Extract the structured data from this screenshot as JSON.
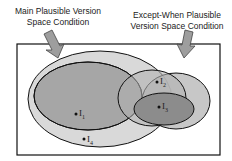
{
  "labels": {
    "main_line1": "Main Plausible Version",
    "main_line2": "Space Condition",
    "except_line1": "Except-When Plausible",
    "except_line2": "Version Space Condition"
  },
  "points": {
    "i1": "I",
    "i1_sub": "1",
    "i2": "I",
    "i2_sub": "2",
    "i3": "I",
    "i3_sub": "3",
    "i4": "I",
    "i4_sub": "4"
  },
  "colors": {
    "outer_ellipse": "#d9d9d9",
    "main_ellipse": "#a6a6a6",
    "except_outer": "#bdbdbd",
    "except_inner": "#8c8c8c",
    "arrow": "#9e9e9e",
    "stroke": "#111111"
  }
}
